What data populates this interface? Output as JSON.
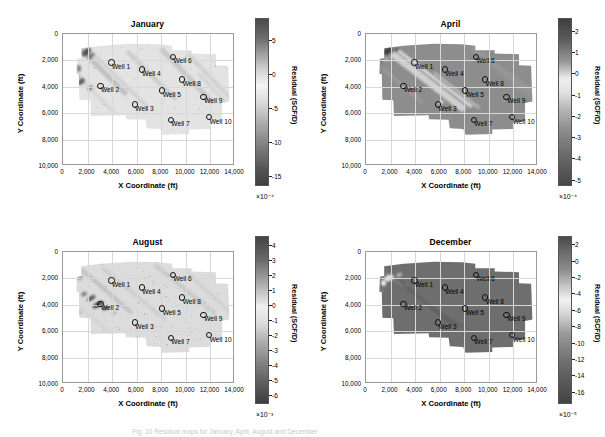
{
  "figure": {
    "caption": "Fig. 10 Residual maps for January, April, August and December"
  },
  "axis": {
    "xlabel": "X Coordinate (ft)",
    "ylabel": "Y Coordinate (ft)",
    "xticks": [
      "0",
      "2,000",
      "4,000",
      "6,000",
      "8,000",
      "10,000",
      "12,000",
      "14,000"
    ],
    "yticks": [
      "0",
      "2,000",
      "4,000",
      "6,000",
      "8,000",
      "10,000"
    ],
    "xlim": [
      0,
      14000
    ],
    "ylim": [
      0,
      10000
    ]
  },
  "colorbar": {
    "title": "Residual (SCF/D)"
  },
  "wells": [
    {
      "name": "Well 1",
      "x": 3950,
      "y": 2150
    },
    {
      "name": "Well 2",
      "x": 3050,
      "y": 3920
    },
    {
      "name": "Well 3",
      "x": 5850,
      "y": 5350
    },
    {
      "name": "Well 4",
      "x": 6420,
      "y": 2700
    },
    {
      "name": "Well 5",
      "x": 8080,
      "y": 4270
    },
    {
      "name": "Well 6",
      "x": 8950,
      "y": 1720
    },
    {
      "name": "Well 7",
      "x": 8780,
      "y": 6500
    },
    {
      "name": "Well 8",
      "x": 9700,
      "y": 3440
    },
    {
      "name": "Well 9",
      "x": 11450,
      "y": 4750
    },
    {
      "name": "Well 10",
      "x": 11900,
      "y": 6310
    }
  ],
  "chart_data": [
    {
      "type": "heatmap",
      "title": "January",
      "xlabel": "X Coordinate (ft)",
      "ylabel": "Y Coordinate (ft)",
      "zlabel": "Residual (SCF/D)",
      "exponent": "×10⁻⁴",
      "cticks": [
        "5",
        "0",
        "-5",
        "-10",
        "-15"
      ],
      "ctick_values": [
        5,
        0,
        -5,
        -10,
        -15
      ],
      "clim": [
        -16.5,
        8.2
      ],
      "grid": true,
      "description": "Mostly near-zero light field with diagonal NW-SE streaks; dark negative anomalies concentrated along the upper-left and left edge."
    },
    {
      "type": "heatmap",
      "title": "April",
      "xlabel": "X Coordinate (ft)",
      "ylabel": "Y Coordinate (ft)",
      "zlabel": "Residual (SCF/D)",
      "exponent": "×10⁻⁴",
      "cticks": [
        "2",
        "1",
        "0",
        "-1",
        "-2",
        "-3",
        "-4",
        "-5"
      ],
      "ctick_values": [
        2,
        1,
        0,
        -1,
        -2,
        -3,
        -4,
        -5
      ],
      "clim": [
        -5.3,
        2.6
      ],
      "grid": true,
      "description": "Mid-gray field crossed by a bright light diagonal band running from upper-left to lower-right; dark patch at the far upper-left corner."
    },
    {
      "type": "heatmap",
      "title": "August",
      "xlabel": "X Coordinate (ft)",
      "ylabel": "Y Coordinate (ft)",
      "zlabel": "Residual (SCF/D)",
      "exponent": "×10⁻³",
      "cticks": [
        "4",
        "3",
        "2",
        "1",
        "0",
        "-1",
        "-2",
        "-3",
        "-4",
        "-5",
        "-6"
      ],
      "ctick_values": [
        4,
        3,
        2,
        1,
        0,
        -1,
        -2,
        -3,
        -4,
        -5,
        -6
      ],
      "clim": [
        -6.6,
        4.6
      ],
      "grid": true,
      "description": "Light near-zero field with a dense cluster of dark negative anomalies concentrated around Well 2 in the left-center region."
    },
    {
      "type": "heatmap",
      "title": "December",
      "xlabel": "X Coordinate (ft)",
      "ylabel": "Y Coordinate (ft)",
      "zlabel": "Residual (SCF/D)",
      "exponent": "×10⁻⁵",
      "cticks": [
        "2",
        "0",
        "-2",
        "-4",
        "-6",
        "-8",
        "-10",
        "-12",
        "-14",
        "-16"
      ],
      "ctick_values": [
        2,
        0,
        -2,
        -4,
        -6,
        -8,
        -10,
        -12,
        -14,
        -16
      ],
      "clim": [
        -17.5,
        3
      ],
      "grid": true,
      "description": "Nearly uniform mid-dark field with a bright light wedge in the upper-left corner and a faint dark diagonal streak through the center."
    }
  ]
}
